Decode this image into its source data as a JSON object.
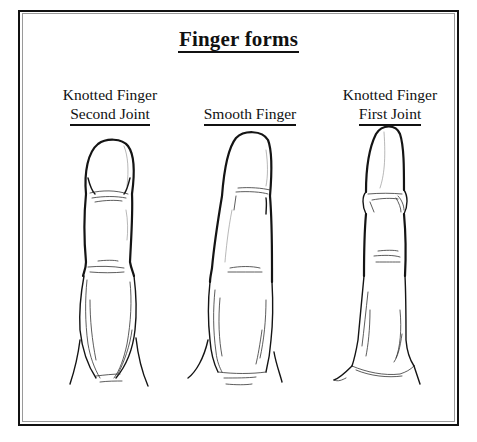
{
  "figure": {
    "title": "Finger forms",
    "border": {
      "outer_color": "#111111",
      "inner_color": "#9a9a9a"
    },
    "fingers": [
      {
        "id": "left",
        "label_line1": "Knotted Finger",
        "label_line2": "Second Joint"
      },
      {
        "id": "middle",
        "label_line1": "Smooth Finger",
        "label_line2": ""
      },
      {
        "id": "right",
        "label_line1": "Knotted Finger",
        "label_line2": "First Joint"
      }
    ]
  }
}
